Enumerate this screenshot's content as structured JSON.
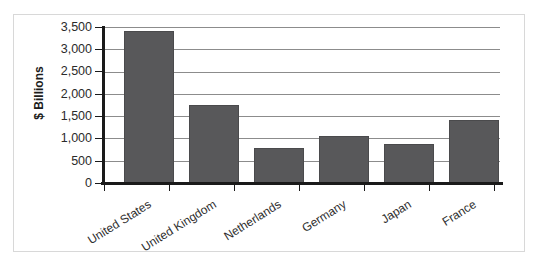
{
  "chart_data": {
    "type": "bar",
    "title": "",
    "subtitle": "",
    "xlabel": "",
    "ylabel": "$ Billions",
    "categories": [
      "United States",
      "United Kingdom",
      "Netherlands",
      "Germany",
      "Japan",
      "France"
    ],
    "values": [
      3400,
      1740,
      790,
      1060,
      880,
      1420
    ],
    "series": [
      {
        "name": "",
        "values": [
          3400,
          1740,
          790,
          1060,
          880,
          1420
        ]
      }
    ],
    "ylim": [
      0,
      3500
    ],
    "ytick_values": [
      0,
      500,
      1000,
      1500,
      2000,
      2500,
      3000,
      3500
    ],
    "ytick_labels": [
      "0",
      "500",
      "1,000",
      "1,500",
      "2,000",
      "2,500",
      "3,000",
      "3,500"
    ],
    "grid": true,
    "grid_axis": "y",
    "legend": false,
    "legend_position": "none",
    "bar_color": "#58585A",
    "gridline_color": "#8C8C8C",
    "axis_color": "#1A1A1A",
    "background_color": "#FFFFFF",
    "category_label_rotation": -32
  }
}
